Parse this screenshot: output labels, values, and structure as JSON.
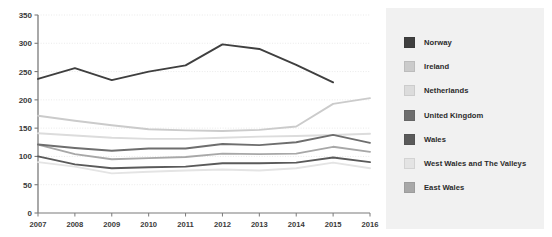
{
  "chart_data": {
    "type": "line",
    "title": "",
    "xlabel": "",
    "ylabel": "",
    "x": [
      2007,
      2008,
      2009,
      2010,
      2011,
      2012,
      2013,
      2014,
      2015,
      2016
    ],
    "categories": [
      "2007",
      "2008",
      "2009",
      "2010",
      "2011",
      "2012",
      "2013",
      "2014",
      "2015",
      "2016"
    ],
    "ylim": [
      0,
      350
    ],
    "yticks": [
      0,
      50,
      100,
      150,
      200,
      250,
      300,
      350
    ],
    "ytick_labels": [
      "0",
      "50",
      "100",
      "150",
      "200",
      "250",
      "300",
      "350"
    ],
    "grid": true,
    "grid_axis": "y",
    "legend_position": "right",
    "series": [
      {
        "name": "Norway",
        "color": "#3f3f3f",
        "values": [
          237,
          256,
          235,
          250,
          261,
          298,
          290,
          262,
          231,
          null
        ]
      },
      {
        "name": "Ireland",
        "color": "#cbcbcb",
        "values": [
          172,
          163,
          155,
          148,
          146,
          145,
          147,
          153,
          193,
          203
        ]
      },
      {
        "name": "Netherlands",
        "color": "#dcdcdc",
        "values": [
          141,
          137,
          133,
          131,
          131,
          133,
          135,
          136,
          138,
          140
        ]
      },
      {
        "name": "United Kingdom",
        "color": "#6e6e6e",
        "values": [
          121,
          115,
          110,
          114,
          114,
          122,
          120,
          125,
          138,
          124
        ]
      },
      {
        "name": "Wales",
        "color": "#5a5a5a",
        "values": [
          100,
          86,
          79,
          81,
          82,
          88,
          88,
          89,
          98,
          90
        ]
      },
      {
        "name": "West Wales and The Valleys",
        "color": "#e4e4e4",
        "values": [
          90,
          82,
          70,
          73,
          75,
          77,
          75,
          79,
          89,
          79
        ]
      },
      {
        "name": "East Wales",
        "color": "#a8a8a8",
        "values": [
          121,
          104,
          95,
          97,
          99,
          105,
          104,
          105,
          117,
          108
        ]
      }
    ]
  },
  "legend": {
    "items": [
      {
        "label": "Norway",
        "color": "#3f3f3f"
      },
      {
        "label": "Ireland",
        "color": "#cbcbcb"
      },
      {
        "label": "Netherlands",
        "color": "#dcdcdc"
      },
      {
        "label": "United Kingdom",
        "color": "#6e6e6e"
      },
      {
        "label": "Wales",
        "color": "#5a5a5a"
      },
      {
        "label": "West Wales and The Valleys",
        "color": "#e4e4e4"
      },
      {
        "label": "East Wales",
        "color": "#a8a8a8"
      }
    ]
  },
  "style": {
    "axis_color": "#7a7a7a",
    "grid_color": "#e8e8e8",
    "legend_background": "#f1f1f1",
    "plot_background": "#ffffff"
  }
}
